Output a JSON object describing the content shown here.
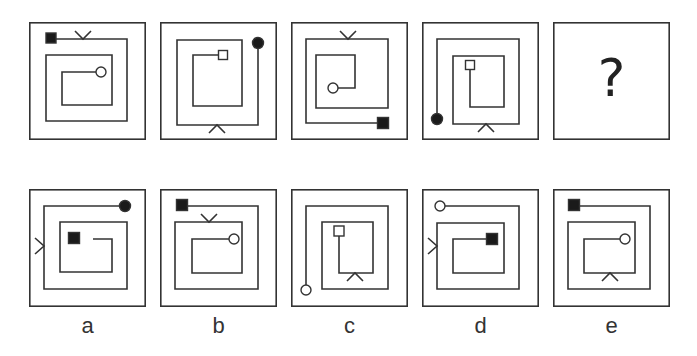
{
  "puzzle": {
    "stroke_color": "#333333",
    "question_mark": "?",
    "top_row": [
      {
        "id": "p1",
        "x": 29,
        "y": 22,
        "path": [
          [
            26,
            17
          ],
          [
            98,
            17
          ],
          [
            98,
            99
          ],
          [
            17,
            99
          ],
          [
            17,
            33
          ],
          [
            83,
            33
          ],
          [
            83,
            83
          ],
          [
            33,
            83
          ],
          [
            33,
            50
          ],
          [
            67,
            50
          ]
        ],
        "start": {
          "shape": "filled-square",
          "cx": 22,
          "cy": 16,
          "size": 10
        },
        "end": {
          "shape": "hollow-circle",
          "cx": 72,
          "cy": 50,
          "r": 5
        },
        "marker": {
          "shape": "v-down",
          "x": 54,
          "y": 17,
          "side": "top"
        }
      },
      {
        "id": "p2",
        "x": 160,
        "y": 22,
        "path": [
          [
            98,
            22
          ],
          [
            98,
            103
          ],
          [
            17,
            103
          ],
          [
            17,
            18
          ],
          [
            82,
            18
          ],
          [
            82,
            84
          ],
          [
            33,
            84
          ],
          [
            33,
            33
          ],
          [
            58,
            33
          ]
        ],
        "start": {
          "shape": "filled-circle",
          "cx": 98,
          "cy": 21,
          "r": 5.5
        },
        "end": {
          "shape": "hollow-square",
          "cx": 63,
          "cy": 33,
          "size": 9
        },
        "marker": {
          "shape": "v-up",
          "x": 57,
          "y": 103,
          "side": "bottom"
        }
      },
      {
        "id": "p3",
        "x": 291,
        "y": 22,
        "path": [
          [
            86,
            101
          ],
          [
            15,
            101
          ],
          [
            15,
            17
          ],
          [
            97,
            17
          ],
          [
            97,
            86
          ],
          [
            25,
            86
          ],
          [
            25,
            33
          ],
          [
            64,
            33
          ],
          [
            64,
            66
          ],
          [
            47,
            66
          ]
        ],
        "start": {
          "shape": "filled-square",
          "cx": 92,
          "cy": 101,
          "size": 11
        },
        "end": {
          "shape": "hollow-circle",
          "cx": 42,
          "cy": 66,
          "r": 5
        },
        "marker": {
          "shape": "v-down",
          "x": 57,
          "y": 17,
          "side": "top"
        }
      },
      {
        "id": "p4",
        "x": 422,
        "y": 22,
        "path": [
          [
            15,
            96
          ],
          [
            15,
            17
          ],
          [
            97,
            17
          ],
          [
            97,
            102
          ],
          [
            31,
            102
          ],
          [
            31,
            34
          ],
          [
            82,
            34
          ],
          [
            82,
            85
          ],
          [
            48,
            85
          ],
          [
            48,
            47
          ]
        ],
        "start": {
          "shape": "filled-circle",
          "cx": 15,
          "cy": 97,
          "r": 5.5
        },
        "end": {
          "shape": "hollow-square",
          "cx": 48,
          "cy": 43,
          "size": 9
        },
        "marker": {
          "shape": "v-up",
          "x": 64,
          "y": 102,
          "side": "bottom"
        }
      },
      {
        "id": "p5",
        "x": 553,
        "y": 22,
        "question": true
      }
    ],
    "options": [
      {
        "id": "a",
        "label": "a",
        "x": 29,
        "y": 189,
        "path": [
          [
            95,
            17
          ],
          [
            15,
            17
          ],
          [
            15,
            100
          ],
          [
            98,
            100
          ],
          [
            98,
            33
          ],
          [
            31,
            33
          ],
          [
            31,
            83
          ],
          [
            83,
            83
          ],
          [
            83,
            50
          ],
          [
            64,
            50
          ]
        ],
        "start": {
          "shape": "filled-circle",
          "cx": 96,
          "cy": 17,
          "r": 5.5
        },
        "end": {
          "shape": "filled-square",
          "cx": 45,
          "cy": 49,
          "size": 11
        },
        "marker": {
          "shape": "v-right",
          "x": 15,
          "y": 57,
          "side": "left"
        }
      },
      {
        "id": "b",
        "label": "b",
        "x": 160,
        "y": 189,
        "path": [
          [
            26,
            17
          ],
          [
            98,
            17
          ],
          [
            98,
            100
          ],
          [
            15,
            100
          ],
          [
            15,
            33
          ],
          [
            82,
            33
          ],
          [
            82,
            84
          ],
          [
            32,
            84
          ],
          [
            32,
            50
          ],
          [
            69,
            50
          ]
        ],
        "start": {
          "shape": "filled-square",
          "cx": 22,
          "cy": 16,
          "size": 11
        },
        "end": {
          "shape": "hollow-circle",
          "cx": 74,
          "cy": 50,
          "r": 5
        },
        "marker": {
          "shape": "v-down",
          "x": 49,
          "y": 33,
          "side": "top"
        }
      },
      {
        "id": "c",
        "label": "c",
        "x": 291,
        "y": 189,
        "path": [
          [
            15,
            96
          ],
          [
            15,
            17
          ],
          [
            97,
            17
          ],
          [
            97,
            100
          ],
          [
            31,
            100
          ],
          [
            31,
            33
          ],
          [
            82,
            33
          ],
          [
            82,
            84
          ],
          [
            48,
            84
          ],
          [
            48,
            46
          ]
        ],
        "start": {
          "shape": "hollow-circle",
          "cx": 15,
          "cy": 101,
          "r": 5
        },
        "end": {
          "shape": "hollow-square",
          "cx": 48,
          "cy": 42,
          "size": 10
        },
        "marker": {
          "shape": "v-up",
          "x": 64,
          "y": 84,
          "side": "bottom"
        }
      },
      {
        "id": "d",
        "label": "d",
        "x": 422,
        "y": 189,
        "path": [
          [
            23,
            17
          ],
          [
            97,
            17
          ],
          [
            97,
            100
          ],
          [
            15,
            100
          ],
          [
            15,
            34
          ],
          [
            82,
            34
          ],
          [
            82,
            84
          ],
          [
            31,
            84
          ],
          [
            31,
            50
          ],
          [
            66,
            50
          ]
        ],
        "start": {
          "shape": "hollow-circle",
          "cx": 18,
          "cy": 17,
          "r": 5
        },
        "end": {
          "shape": "filled-square",
          "cx": 70,
          "cy": 50,
          "size": 11
        },
        "marker": {
          "shape": "v-right",
          "x": 15,
          "y": 57,
          "side": "left"
        }
      },
      {
        "id": "e",
        "label": "e",
        "x": 553,
        "y": 189,
        "path": [
          [
            25,
            17
          ],
          [
            97,
            17
          ],
          [
            97,
            100
          ],
          [
            15,
            100
          ],
          [
            15,
            33
          ],
          [
            82,
            33
          ],
          [
            82,
            84
          ],
          [
            31,
            84
          ],
          [
            31,
            50
          ],
          [
            67,
            50
          ]
        ],
        "start": {
          "shape": "filled-square",
          "cx": 21,
          "cy": 16,
          "size": 11
        },
        "end": {
          "shape": "hollow-circle",
          "cx": 72,
          "cy": 50,
          "r": 5
        },
        "marker": {
          "shape": "v-up",
          "x": 57,
          "y": 84,
          "side": "bottom"
        }
      }
    ]
  }
}
